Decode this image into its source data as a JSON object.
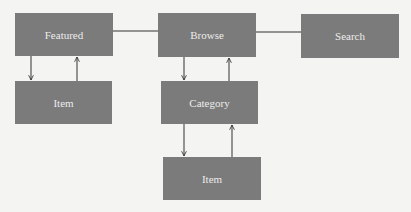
{
  "diagram": {
    "type": "navigation-hierarchy",
    "nodes": [
      {
        "id": "featured",
        "label": "Featured",
        "x": 15,
        "y": 13,
        "w": 98,
        "h": 43
      },
      {
        "id": "browse",
        "label": "Browse",
        "x": 158,
        "y": 13,
        "w": 98,
        "h": 44
      },
      {
        "id": "search",
        "label": "Search",
        "x": 301,
        "y": 14,
        "w": 98,
        "h": 44
      },
      {
        "id": "item-featured",
        "label": "Item",
        "x": 15,
        "y": 81,
        "w": 97,
        "h": 43
      },
      {
        "id": "category",
        "label": "Category",
        "x": 161,
        "y": 81,
        "w": 97,
        "h": 43
      },
      {
        "id": "item-category",
        "label": "Item",
        "x": 163,
        "y": 157,
        "w": 98,
        "h": 43
      }
    ],
    "edges": [
      {
        "from": "featured",
        "to": "browse",
        "type": "line"
      },
      {
        "from": "browse",
        "to": "search",
        "type": "line"
      },
      {
        "from": "featured",
        "to": "item-featured",
        "type": "arrow-down"
      },
      {
        "from": "item-featured",
        "to": "featured",
        "type": "arrow-up"
      },
      {
        "from": "browse",
        "to": "category",
        "type": "arrow-down"
      },
      {
        "from": "category",
        "to": "browse",
        "type": "arrow-up"
      },
      {
        "from": "category",
        "to": "item-category",
        "type": "arrow-down"
      },
      {
        "from": "item-category",
        "to": "category",
        "type": "arrow-up"
      }
    ]
  },
  "colors": {
    "node_fill": "#7b7b7b",
    "node_text": "#ececec",
    "edge": "#333333",
    "background": "#f4f4f2"
  }
}
